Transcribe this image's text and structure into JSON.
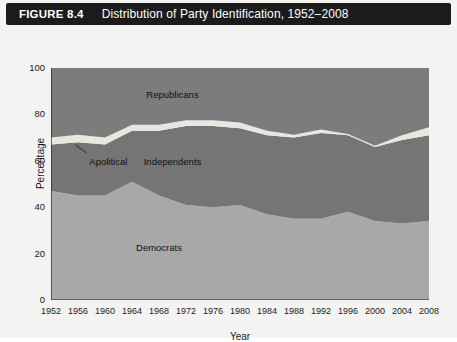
{
  "figure": {
    "number_label": "FIGURE 8.4",
    "title": "Distribution of Party Identification, 1952–2008"
  },
  "colors": {
    "title_bar_bg": "#1b1b1b",
    "title_bar_text": "#ffffff",
    "panel_bg": "#f3f3f1",
    "republicans": "#7c7c7c",
    "independents": "#757575",
    "apolitical": "#e8e6de",
    "democrats": "#a8a8a8",
    "axis": "#1b1b1b"
  },
  "chart_data": {
    "type": "area",
    "stacked": true,
    "title": "Distribution of Party Identification, 1952–2008",
    "xlabel": "Year",
    "ylabel": "Percentage",
    "ylim": [
      0,
      100
    ],
    "yticks": [
      0,
      20,
      40,
      60,
      80,
      100
    ],
    "xlim": [
      1952,
      2008
    ],
    "grid": false,
    "legend_position": "in-plot-annotations",
    "categories": [
      1952,
      1956,
      1960,
      1964,
      1968,
      1972,
      1976,
      1980,
      1984,
      1988,
      1992,
      1996,
      2000,
      2004,
      2008
    ],
    "x": [
      1952,
      1956,
      1960,
      1964,
      1968,
      1972,
      1976,
      1980,
      1984,
      1988,
      1992,
      1996,
      2000,
      2004,
      2008
    ],
    "series": [
      {
        "name": "Democrats",
        "color": "#a8a8a8",
        "values": [
          47,
          45,
          45,
          51,
          45,
          41,
          40,
          41,
          37,
          35,
          35,
          38,
          34,
          33,
          34
        ]
      },
      {
        "name": "Independents",
        "color": "#757575",
        "values": [
          20,
          23,
          22,
          22,
          28,
          34,
          35,
          33,
          34,
          35,
          37,
          33,
          32,
          36,
          37
        ]
      },
      {
        "name": "Apolitical",
        "color": "#e8e6de",
        "values": [
          3.0,
          3.2,
          3.0,
          2.5,
          2.5,
          2.5,
          2.5,
          2.5,
          2.0,
          1.2,
          1.5,
          0.6,
          0.5,
          2.0,
          3.5
        ]
      },
      {
        "name": "Republicans",
        "color": "#7c7c7c",
        "values": [
          30,
          28.8,
          30,
          24.5,
          24.5,
          22.5,
          22.5,
          23.5,
          27,
          28.8,
          26.5,
          28.4,
          33.5,
          29,
          25.5
        ]
      }
    ],
    "annotations": [
      {
        "text": "Republicans",
        "x": 1970,
        "y": 88
      },
      {
        "text": "Independents",
        "x": 1970,
        "y": 59
      },
      {
        "text": "Apolitical",
        "x": 1960.5,
        "y": 59,
        "has_callout_line": true
      },
      {
        "text": "Democrats",
        "x": 1968,
        "y": 22
      }
    ],
    "xtick_labels": [
      "1952",
      "1956",
      "1960",
      "1964",
      "1968",
      "1972",
      "1976",
      "1980",
      "1984",
      "1988",
      "1992",
      "1996",
      "2000",
      "2004",
      "2008"
    ],
    "ytick_labels": [
      "0",
      "20",
      "40",
      "60",
      "80",
      "100"
    ]
  }
}
